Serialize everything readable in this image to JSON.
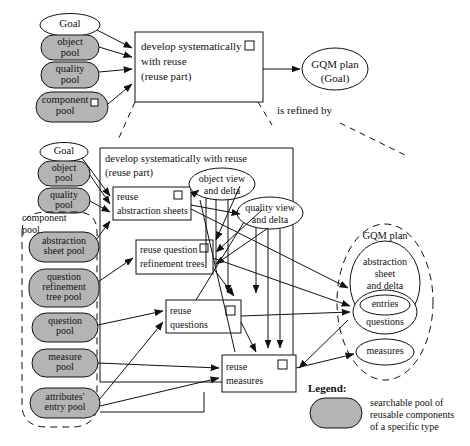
{
  "diagram": {
    "title_note": "is refined by",
    "legend": {
      "title": "Legend:",
      "description": "searchable pool of\nreusable components\nof a specific type"
    },
    "colors": {
      "pool_fill": "#b4b4b4",
      "stroke": "#111111",
      "background": "#ffffff"
    },
    "top_level": {
      "goal": "Goal",
      "pools": [
        {
          "label": "object\npool"
        },
        {
          "label": "quality\npool"
        },
        {
          "label": "component\npool"
        }
      ],
      "process": "develop systematically\nwith reuse\n(reuse part)",
      "output": "GQM plan\n(Goal)"
    },
    "detail": {
      "header": "develop systematically with reuse\n(reuse part)",
      "goal": "Goal",
      "input_pools": [
        {
          "label": "object\npool"
        },
        {
          "label": "quality\npool"
        }
      ],
      "component_pool_label": "component\npool",
      "component_pools": [
        {
          "label": "abstraction\nsheet pool"
        },
        {
          "label": "question\nrefinement\ntree pool"
        },
        {
          "label": "question\npool"
        },
        {
          "label": "measure\npool"
        },
        {
          "label": "attributes'\nentry pool"
        }
      ],
      "activities": [
        {
          "label": "reuse\nabstraction sheets"
        },
        {
          "label": "reuse question\nrefinement trees"
        },
        {
          "label": "reuse\nquestions"
        },
        {
          "label": "reuse\nmeasures"
        }
      ],
      "views": [
        {
          "label": "object view\nand delta"
        },
        {
          "label": "quality view\nand delta"
        }
      ],
      "gqm_plan": {
        "label": "GQM plan",
        "parts": [
          {
            "label": "abstraction\nsheet\nand delta"
          },
          {
            "label": "entries"
          },
          {
            "label": "questions"
          },
          {
            "label": "measures"
          }
        ]
      }
    }
  }
}
